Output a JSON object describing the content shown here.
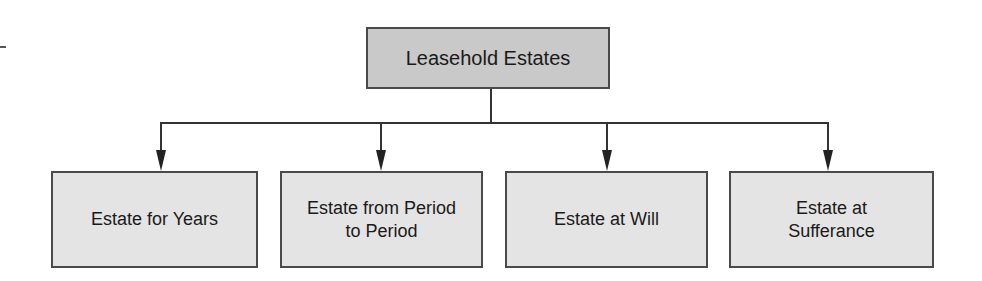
{
  "diagram": {
    "type": "hierarchy-tree",
    "colors": {
      "root_fill": "#c9c9c9",
      "child_fill": "#e4e4e4",
      "border": "#4a4a4a",
      "line": "#333333",
      "text": "#1a1a1a"
    },
    "root": {
      "label": "Leasehold Estates"
    },
    "children": [
      {
        "label_line1": "Estate for Years",
        "label_line2": ""
      },
      {
        "label_line1": "Estate from Period",
        "label_line2": "to Period"
      },
      {
        "label_line1": "Estate at Will",
        "label_line2": ""
      },
      {
        "label_line1": "Estate at",
        "label_line2": "Sufferance"
      }
    ]
  }
}
